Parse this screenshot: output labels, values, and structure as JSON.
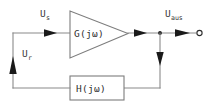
{
  "diagram": {
    "background_color": "#ffffff",
    "wire_color": "#8a8a8a",
    "arrow_color": "#1a1a1a",
    "text_color": "#3a3a3a",
    "blocks": {
      "forward": {
        "shape": "triangle",
        "label": "G(jω)",
        "name": "forward-gain-block"
      },
      "feedback": {
        "shape": "rectangle",
        "label": "H(jω)",
        "name": "feedback-gain-block"
      }
    },
    "signals": {
      "input": {
        "base": "U",
        "sub": "s",
        "full": "Uₛ"
      },
      "feedback": {
        "base": "U",
        "sub": "r",
        "full": "Uᵣ"
      },
      "output": {
        "base": "U",
        "sub": "aus",
        "full": "Uₐᵤₛ"
      }
    },
    "nodes": {
      "summing_corner": "top-left-corner",
      "output_junction": "output-tap-junction",
      "output_terminal": "open-circle-terminal"
    }
  }
}
